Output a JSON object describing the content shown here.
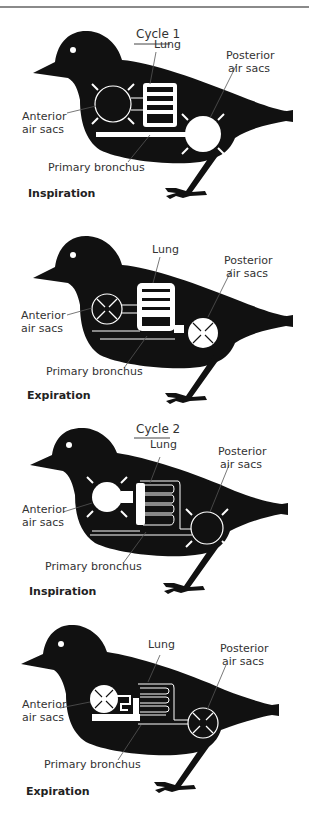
{
  "figure": {
    "labels": {
      "lung": "Lung",
      "posterior_1": "Posterior",
      "posterior_2": "air sacs",
      "anterior_1": "Anterior",
      "anterior_2": "air sacs",
      "bronchus": "Primary bronchus"
    },
    "panels": [
      {
        "cycle": "Cycle 1",
        "phase": "Inspiration",
        "anterior_sac": "expanding",
        "posterior_sac": "expanding",
        "lung_air": "partial",
        "top": 10
      },
      {
        "cycle": "",
        "phase": "Expiration",
        "anterior_sac": "contracting",
        "posterior_sac": "contracting",
        "lung_air": "filled",
        "top": 215
      },
      {
        "cycle": "Cycle 2",
        "phase": "Inspiration",
        "anterior_sac": "expanding",
        "posterior_sac": "expanding",
        "lung_air": "partial",
        "top": 415
      },
      {
        "cycle": "",
        "phase": "Expiration",
        "anterior_sac": "contracting",
        "posterior_sac": "contracting",
        "lung_air": "channels",
        "top": 620
      }
    ],
    "colors": {
      "bird": "#111111",
      "air": "#ffffff",
      "text": "#333333",
      "leader": "#555555"
    }
  }
}
